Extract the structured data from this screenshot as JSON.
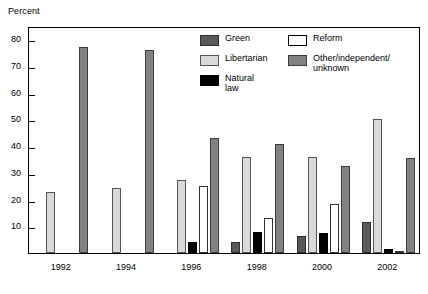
{
  "chart_data": {
    "type": "bar",
    "title": "",
    "xlabel": "",
    "ylabel": "Percent",
    "ylim": [
      0,
      85
    ],
    "yticks": [
      10,
      20,
      30,
      40,
      50,
      60,
      70,
      80
    ],
    "grid": false,
    "legend_position": "top-right-inside",
    "categories": [
      "1992",
      "1994",
      "1996",
      "1998",
      "2000",
      "2002"
    ],
    "series": [
      {
        "name": "Green",
        "color": "#595959",
        "values": [
          0,
          0,
          0,
          4,
          6.5,
          11.5
        ]
      },
      {
        "name": "Libertarian",
        "color": "#d9d9d9",
        "values": [
          23,
          24.5,
          27.5,
          36,
          36,
          50
        ]
      },
      {
        "name": "Natural law",
        "color": "#000000",
        "values": [
          0,
          0,
          4,
          8,
          7.5,
          1.5
        ]
      },
      {
        "name": "Reform",
        "color": "#ffffff",
        "values": [
          0,
          0,
          25,
          13,
          18.5,
          0.8
        ]
      },
      {
        "name": "Other/independent/\nunknown",
        "color": "#828282",
        "values": [
          77,
          76,
          43,
          41,
          32.5,
          35.5
        ]
      }
    ]
  },
  "axis": {
    "y_title": "Percent"
  },
  "legend": {
    "column_1": [
      {
        "label": "Green",
        "swatch": "c-green"
      },
      {
        "label": "Libertarian",
        "swatch": "c-libertarian"
      },
      {
        "label": "Natural law",
        "swatch": "c-natural"
      }
    ],
    "column_2": [
      {
        "label": "Reform",
        "swatch": "c-reform"
      },
      {
        "label": "Other/independent/\nunknown",
        "swatch": "c-other"
      }
    ]
  }
}
